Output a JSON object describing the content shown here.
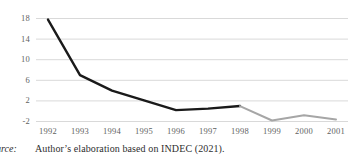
{
  "chart_data": {
    "type": "line",
    "title": "",
    "subtitle": "",
    "xlabel": "",
    "ylabel": "",
    "categories": [
      "1992",
      "1993",
      "1994",
      "1995",
      "1996",
      "1997",
      "1998",
      "1999",
      "2000",
      "2001"
    ],
    "ytick_labels": [
      "18",
      "14",
      "10",
      "6",
      "2",
      "-2"
    ],
    "ytick_values": [
      18,
      14,
      10,
      6,
      2,
      -2
    ],
    "ylim": [
      -3,
      19
    ],
    "grid": true,
    "grid_axis": "y",
    "legend": "none",
    "series": [
      {
        "name": "observed-black",
        "color": "#1a1a1a",
        "x": [
          "1992",
          "1993",
          "1994",
          "1995",
          "1996",
          "1997",
          "1998"
        ],
        "values": [
          17.8,
          7.0,
          4.0,
          2.1,
          0.2,
          0.5,
          1.0
        ]
      },
      {
        "name": "observed-grey",
        "color": "#a6a6a6",
        "x": [
          "1998",
          "1999",
          "2000",
          "2001"
        ],
        "values": [
          1.0,
          -1.8,
          -0.8,
          -1.6
        ]
      }
    ],
    "values": [
      17.8,
      7.0,
      4.0,
      2.1,
      0.2,
      0.5,
      1.0,
      -1.8,
      -0.8,
      -1.6
    ]
  },
  "caption": {
    "prefix": "Source:",
    "text": "Author’s elaboration based on INDEC (2021)."
  },
  "colors": {
    "series_black": "#1a1a1a",
    "series_grey": "#a6a6a6",
    "gridline": "#d9d9d9",
    "tick_text": "#5f5f5f",
    "caption_text": "#2e2e2e",
    "background": "#ffffff"
  }
}
